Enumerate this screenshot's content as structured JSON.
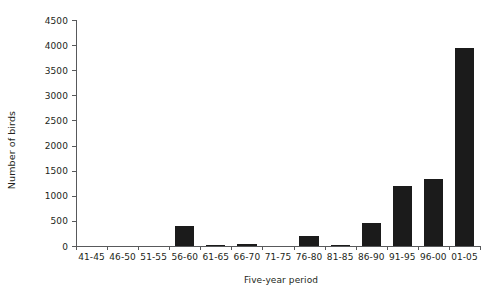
{
  "chart_data": {
    "type": "bar",
    "title": "",
    "xlabel": "Five-year period",
    "ylabel": "Number of birds",
    "categories": [
      "41-45",
      "46-50",
      "51-55",
      "56-60",
      "61-65",
      "66-70",
      "71-75",
      "76-80",
      "81-85",
      "86-90",
      "91-95",
      "96-00",
      "01-05"
    ],
    "values": [
      0,
      0,
      0,
      400,
      15,
      45,
      0,
      200,
      25,
      450,
      1200,
      1330,
      3950
    ],
    "ylim": [
      0,
      4500
    ],
    "ytick_values": [
      0,
      500,
      1000,
      1500,
      2000,
      2500,
      3000,
      3500,
      4000,
      4500
    ],
    "ytick_labels": [
      "0",
      "500",
      "1000",
      "1500",
      "2000",
      "2500",
      "3000",
      "3500",
      "4000",
      "4500"
    ],
    "grid": false,
    "legend": "none",
    "bar_color": "#1b1b1b",
    "axis_color": "#58595b"
  }
}
